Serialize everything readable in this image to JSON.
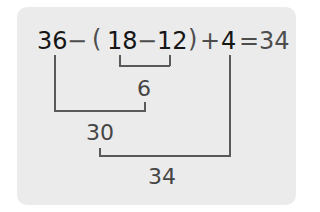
{
  "expression": {
    "n1": "36",
    "op1": "−",
    "lparen": "(",
    "n2": "18",
    "op2": "−",
    "n3": "12",
    "rparen": ")",
    "op3": "+",
    "n4": "4",
    "equals": "=",
    "answer": "34"
  },
  "steps": [
    {
      "operation": "18 − 12",
      "result": "6"
    },
    {
      "operation": "36 − 6",
      "result": "30"
    },
    {
      "operation": "30 + 4",
      "result": "34"
    }
  ],
  "colors": {
    "panel_background": "#ebebeb",
    "operand_text": "#161616",
    "operator_text": "#4d4d4d",
    "line": "#595959"
  }
}
